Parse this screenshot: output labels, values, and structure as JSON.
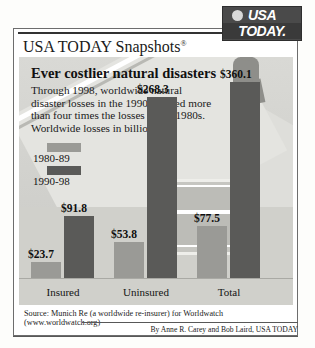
{
  "logo": {
    "line1": "USA",
    "line2": "TODAY.",
    "globe_icon": "globe-icon"
  },
  "masthead": {
    "title": "USA TODAY Snapshots",
    "registered_mark": "®"
  },
  "headline": "Ever costlier natural disasters",
  "deck": "Through 1998, worldwide natural disaster losses in the 1990s totaled more than four times the losses in the 1980s. Worldwide losses in billions:",
  "source": "Source: Munich Re (a worldwide re-insurer) for Worldwatch (www.worldwatch.org)",
  "byline": "By Anne R. Carey and Bob Laird, USA TODAY",
  "colors": {
    "card_background": "#d6d6d2",
    "series_1980_89": "#9a9a96",
    "series_1990_98": "#5a5a58",
    "panel_border": "#6d6d6d",
    "logo_background": "#4a4a4a"
  },
  "chart_data": {
    "type": "bar",
    "title": "Ever costlier natural disasters",
    "xlabel": "",
    "ylabel": "Worldwide losses in billions",
    "ylim": [
      0,
      360.1
    ],
    "grid": false,
    "legend_position": "upper-left",
    "categories": [
      "Insured",
      "Uninsured",
      "Total"
    ],
    "series": [
      {
        "name": "1980-89",
        "color": "#9a9a96",
        "values": [
          23.7,
          53.8,
          77.5
        ],
        "labels": [
          "$23.7",
          "$53.8",
          "$77.5"
        ]
      },
      {
        "name": "1990-98",
        "color": "#5a5a58",
        "values": [
          91.8,
          268.3,
          360.1
        ],
        "labels": [
          "$91.8",
          "$268.3",
          "$360.1"
        ]
      }
    ],
    "annotations": [
      "Worldwide losses in billions:"
    ]
  },
  "bars": [
    {
      "label": "$23.7",
      "series": "1980-89",
      "left": 12,
      "width": 30,
      "height": 16,
      "label_left": 9,
      "label_bottom": 45
    },
    {
      "label": "$91.8",
      "series": "1990-98",
      "left": 45,
      "width": 30,
      "height": 62,
      "label_left": 42,
      "label_bottom": 91
    },
    {
      "label": "$53.8",
      "series": "1980-89",
      "left": 95,
      "width": 30,
      "height": 36,
      "label_left": 92,
      "label_bottom": 65
    },
    {
      "label": "$268.3",
      "series": "1990-98",
      "left": 128,
      "width": 30,
      "height": 181,
      "label_left": 118,
      "label_bottom": 210
    },
    {
      "label": "$77.5",
      "series": "1980-89",
      "left": 178,
      "width": 30,
      "height": 52,
      "label_left": 175,
      "label_bottom": 81
    },
    {
      "label": "$360.1",
      "series": "1990-98",
      "left": 211,
      "width": 30,
      "height": 196,
      "label_left": 201,
      "label_bottom": 225
    }
  ],
  "category_positions": [
    {
      "label": "Insured",
      "left": 10,
      "width": 68
    },
    {
      "label": "Uninsured",
      "left": 92,
      "width": 70
    },
    {
      "label": "Total",
      "left": 176,
      "width": 68
    }
  ]
}
